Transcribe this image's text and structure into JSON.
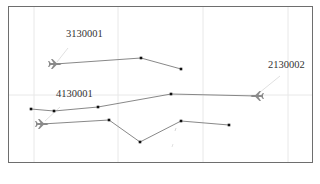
{
  "map": {
    "background": "#ffffff",
    "border_color": "#6e6e6e",
    "grid_color": "#e8e8e8",
    "track_color": "#7a7a7a",
    "point_color": "#111111",
    "plane_color": "#8a8a8a",
    "grid": {
      "vertical_x": [
        34,
        118,
        203,
        288
      ],
      "horizontal_y": [
        95
      ]
    }
  },
  "flights": [
    {
      "id": "3130001",
      "label": "3130001",
      "label_pos": [
        66,
        37
      ],
      "plane_icon": "airplane-icon",
      "plane_pos": [
        55,
        64
      ],
      "heading": "right",
      "track": [
        [
          55,
          64
        ],
        [
          141,
          58
        ],
        [
          181,
          69
        ]
      ]
    },
    {
      "id": "2130002",
      "label": "2130002",
      "label_pos": [
        268,
        68
      ],
      "plane_icon": "airplane-icon",
      "plane_pos": [
        257,
        96
      ],
      "heading": "left",
      "track": [
        [
          31,
          109
        ],
        [
          54,
          111
        ],
        [
          98,
          107
        ],
        [
          171,
          94
        ],
        [
          257,
          96
        ]
      ]
    },
    {
      "id": "4130001",
      "label": "4130001",
      "label_pos": [
        56,
        97
      ],
      "plane_icon": "airplane-icon",
      "plane_pos": [
        42,
        124
      ],
      "heading": "right",
      "track": [
        [
          42,
          124
        ],
        [
          109,
          120
        ],
        [
          140,
          142
        ],
        [
          181,
          121
        ],
        [
          229,
          125
        ]
      ]
    }
  ],
  "leader_lines": [
    {
      "from": [
        68,
        48
      ],
      "to": [
        57,
        62
      ]
    },
    {
      "from": [
        280,
        76
      ],
      "to": [
        259,
        93
      ]
    },
    {
      "from": [
        60,
        107
      ],
      "to": [
        45,
        121
      ]
    }
  ]
}
